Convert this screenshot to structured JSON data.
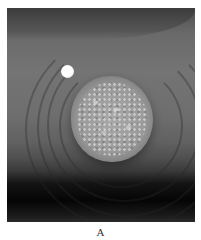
{
  "figure": {
    "panel_label": "A",
    "image": {
      "description": "Grayscale clinical photograph of a raised, rounded skin lesion with a granular/verrucous surface, surrounded by concentric skin folds; a small white circular marker sits to the upper-left of the lesion.",
      "colors": {
        "background": "#ffffff",
        "skin_mid": "#6e6e6e",
        "shadow": "#050505",
        "marker": "#ffffff"
      }
    }
  }
}
